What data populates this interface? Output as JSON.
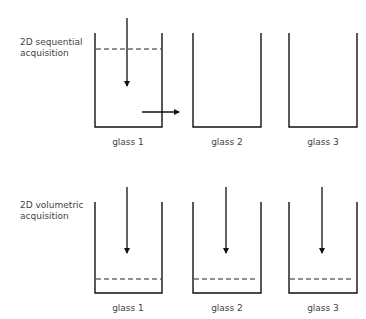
{
  "rows": [
    {
      "title_line1": "2D sequential",
      "title_line2": "acquisition",
      "glasses": [
        {
          "label": "glass 1"
        },
        {
          "label": "glass 2"
        },
        {
          "label": "glass 3"
        }
      ]
    },
    {
      "title_line1": "2D volumetric",
      "title_line2": "acquisition",
      "glasses": [
        {
          "label": "glass 1"
        },
        {
          "label": "glass 2"
        },
        {
          "label": "glass 3"
        }
      ]
    }
  ],
  "colors": {
    "stroke": "#111111",
    "text": "#444444"
  }
}
